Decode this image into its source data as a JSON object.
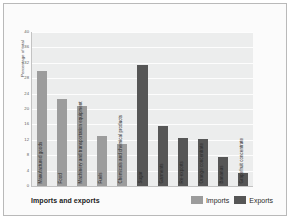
{
  "chart_data": {
    "type": "bar",
    "title": "Imports and exports",
    "xlabel": "",
    "ylabel": "Percentage of total",
    "ylim": [
      0,
      40
    ],
    "yticks": [
      0,
      4,
      8,
      12,
      16,
      20,
      24,
      28,
      32,
      36,
      40
    ],
    "grid": true,
    "legend_position": "bottom-right",
    "categories": [
      "Manufactured goods",
      "Food",
      "Machinery and transportation equipment",
      "Fuels",
      "Chemicals and chemical products",
      "Sugar",
      "Garments",
      "Re-exports",
      "Orange concentrate",
      "Bananas",
      "Grapefruit concentrate"
    ],
    "series": [
      {
        "name": "Imports",
        "color": "#9c9c9c",
        "values": [
          30,
          22.5,
          20.7,
          13,
          11,
          null,
          null,
          null,
          null,
          null,
          null
        ]
      },
      {
        "name": "Exports",
        "color": "#565656",
        "values": [
          null,
          null,
          null,
          null,
          null,
          31.5,
          15.5,
          12.5,
          12.3,
          7.5,
          3.3
        ]
      }
    ],
    "bars": [
      {
        "category": "Manufactured goods",
        "series": "Imports",
        "value": 30
      },
      {
        "category": "Food",
        "series": "Imports",
        "value": 22.5
      },
      {
        "category": "Machinery and transportation equipment",
        "series": "Imports",
        "value": 20.7
      },
      {
        "category": "Fuels",
        "series": "Imports",
        "value": 13
      },
      {
        "category": "Chemicals and chemical products",
        "series": "Imports",
        "value": 11
      },
      {
        "category": "Sugar",
        "series": "Exports",
        "value": 31.5
      },
      {
        "category": "Garments",
        "series": "Exports",
        "value": 15.5
      },
      {
        "category": "Re-exports",
        "series": "Exports",
        "value": 12.5
      },
      {
        "category": "Orange concentrate",
        "series": "Exports",
        "value": 12.3
      },
      {
        "category": "Bananas",
        "series": "Exports",
        "value": 7.5
      },
      {
        "category": "Grapefruit concentrate",
        "series": "Exports",
        "value": 3.3
      }
    ]
  },
  "legend": {
    "items": [
      {
        "label": "Imports",
        "color": "#9c9c9c"
      },
      {
        "label": "Exports",
        "color": "#565656"
      }
    ]
  },
  "colors": {
    "imports": "#9c9c9c",
    "exports": "#565656",
    "plot_background": "#eceded",
    "gridline": "#fdfdfd",
    "figure_background": "#fbfbfb",
    "axis": "#c3c3c3"
  }
}
